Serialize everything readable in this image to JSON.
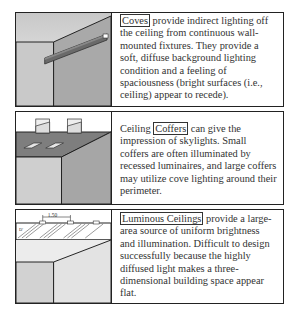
{
  "panels": [
    {
      "term": "Coves",
      "text": " provide indirect lighting off the ceiling from continuous wall-mounted fixtures.  They provide a soft, diffuse background lighting condition and a feeling of spaciousness (bright surfaces (i.e., ceiling) appear to recede).",
      "illustration": "cove-lighting"
    },
    {
      "prefix": "Ceiling ",
      "term": "Coffers",
      "text": " can give the impression of skylights.  Small coffers are often illuminated by recessed luminaires, and large coffers may utilize cove lighting around their perimeter.",
      "illustration": "ceiling-coffers"
    },
    {
      "term": "Luminous Ceilings",
      "text": " provide a large-area source of uniform brightness and illumination.  Difficult to design successfully because the highly diffused light makes a three-dimensional building space appear flat.",
      "illustration": "luminous-ceiling",
      "dimension_label": "1.50",
      "angle_label": "D'"
    }
  ]
}
